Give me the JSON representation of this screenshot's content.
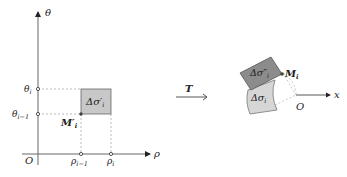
{
  "left_panel": {
    "axis_x_label": "ρ",
    "axis_y_label": "θ",
    "origin_label": "O",
    "theta_i": "θ",
    "theta_i_sub": "i",
    "theta_im1": "θ",
    "theta_im1_sub": "i−1",
    "rho_im1": "ρ",
    "rho_im1_sub": "i−1",
    "rho_i": "ρ",
    "rho_i_sub": "i",
    "cell_label": "Δσ′",
    "cell_label_sub": "i",
    "point_label": "M′",
    "point_label_sub": "i"
  },
  "transform": {
    "label": "T"
  },
  "right_panel": {
    "upper_cell_label": "Δσ″",
    "upper_cell_sub": "i",
    "lower_cell_label": "Δσ",
    "lower_cell_sub": "i",
    "point_label": "M",
    "point_label_sub": "i",
    "origin_label": "O",
    "axis_x_label": "x"
  },
  "colors": {
    "axis": "#555555",
    "dashed": "#aaaaaa",
    "cell_fill_left": "#c8c8c8",
    "cell_fill_dark": "#8c8c8c",
    "cell_fill_light": "#d6d6d6",
    "point": "#444444"
  }
}
